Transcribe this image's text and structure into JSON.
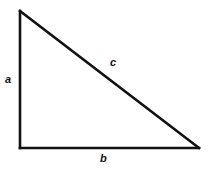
{
  "figure": {
    "background_color": "#ffffff",
    "stroke_color": "#111111",
    "text_color": "#111111",
    "stroke_width": 2.6,
    "width": 210,
    "height": 176
  },
  "labels": {
    "leg_vertical": "a",
    "hypotenuse": "c",
    "leg_horizontal": "b"
  },
  "chart_data": {
    "type": "diagram",
    "shape": "right-triangle",
    "title": "",
    "vertices": {
      "apex": [
        20,
        11
      ],
      "bottom_left": [
        20,
        148
      ],
      "bottom_right": [
        199,
        148
      ]
    },
    "edges": [
      {
        "name": "a",
        "from": "apex",
        "to": "bottom_left",
        "label": "a",
        "label_position": [
          10,
          80
        ]
      },
      {
        "name": "b",
        "from": "bottom_left",
        "to": "bottom_right",
        "label": "b",
        "label_position": [
          104,
          159
        ]
      },
      {
        "name": "c",
        "from": "apex",
        "to": "bottom_right",
        "label": "c",
        "label_position": [
          114,
          63
        ]
      }
    ],
    "right_angle_at": "bottom_left"
  }
}
